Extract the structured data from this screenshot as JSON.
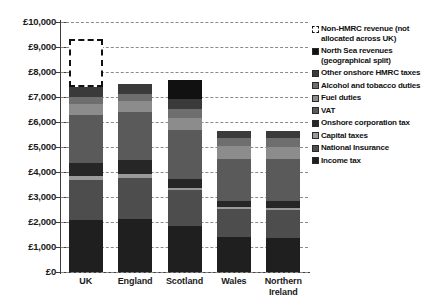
{
  "chart_data": {
    "type": "bar",
    "subtype": "stacked",
    "title": "",
    "xlabel": "",
    "ylabel": "",
    "ylim": [
      0,
      10000
    ],
    "ytick_step": 1000,
    "ytick_labels": [
      "£0",
      "£1,000",
      "£2,000",
      "£3,000",
      "£4,000",
      "£5,000",
      "£6,000",
      "£7,000",
      "£8,000",
      "£9,000",
      "£10,000"
    ],
    "grid": true,
    "legend_position": "right",
    "categories": [
      "UK",
      "England",
      "Scotland",
      "Wales",
      "Northern Ireland"
    ],
    "series": [
      {
        "name": "Income tax",
        "color": "#1f1f1f",
        "values": [
          2080,
          2120,
          1860,
          1400,
          1360
        ]
      },
      {
        "name": "National Insurance",
        "color": "#4d4d4d",
        "values": [
          1600,
          1640,
          1440,
          1120,
          1120
        ]
      },
      {
        "name": "Capital taxes",
        "color": "#9a9a9a",
        "values": [
          160,
          160,
          80,
          80,
          80
        ]
      },
      {
        "name": "Onshore corporation tax",
        "color": "#262626",
        "values": [
          520,
          560,
          360,
          240,
          280
        ]
      },
      {
        "name": "VAT",
        "color": "#5a5a5a",
        "values": [
          1920,
          1920,
          1960,
          1680,
          1680
        ]
      },
      {
        "name": "Fuel duties",
        "color": "#8c8c8c",
        "values": [
          440,
          440,
          480,
          520,
          480
        ]
      },
      {
        "name": "Alcohol and tobacco duties",
        "color": "#6e6e6e",
        "values": [
          280,
          280,
          360,
          320,
          360
        ]
      },
      {
        "name": "Other onshore HMRC taxes",
        "color": "#3a3a3a",
        "values": [
          400,
          400,
          400,
          280,
          280
        ]
      },
      {
        "name": "North Sea revenues (geographical split)",
        "color": "#111111",
        "values": [
          0,
          0,
          760,
          0,
          0
        ]
      },
      {
        "name": "Non-HMRC revenue (not allocated across UK)",
        "color": "#ffffff",
        "values": [
          1920,
          0,
          0,
          0,
          0
        ],
        "style": "dashed-outline"
      }
    ],
    "totals": [
      9320,
      7520,
      7700,
      5640,
      5640
    ]
  },
  "legend": {
    "items": [
      {
        "label": "Non-HMRC revenue (not allocated across UK)",
        "swatch": "dashed-swatch"
      },
      {
        "label": "North Sea revenues (geographical split)",
        "swatch": "solid-swatch"
      },
      {
        "label": "Other onshore HMRC taxes",
        "swatch": "solid-swatch"
      },
      {
        "label": "Alcohol and tobacco duties",
        "swatch": "solid-swatch"
      },
      {
        "label": "Fuel duties",
        "swatch": "solid-swatch"
      },
      {
        "label": "VAT",
        "swatch": "solid-swatch"
      },
      {
        "label": "Onshore corporation tax",
        "swatch": "solid-swatch"
      },
      {
        "label": "Capital taxes",
        "swatch": "solid-swatch"
      },
      {
        "label": "National Insurance",
        "swatch": "solid-swatch"
      },
      {
        "label": "Income tax",
        "swatch": "solid-swatch"
      }
    ]
  }
}
